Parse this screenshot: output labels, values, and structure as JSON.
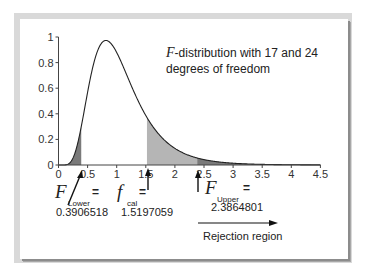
{
  "chart_data": {
    "type": "area",
    "title": "F-distribution with 17 and 24 degrees of freedom",
    "title_lines": [
      "-distribution with 17 and 24",
      "degrees of freedom"
    ],
    "title_italic_prefix": "F",
    "distribution": {
      "name": "F",
      "df1": 17,
      "df2": 24
    },
    "xlabel": "",
    "ylabel": "",
    "xlim": [
      0,
      4.5
    ],
    "ylim": [
      0,
      1
    ],
    "x_ticks": [
      0,
      0.5,
      1,
      1.5,
      2,
      2.5,
      3,
      3.5,
      4,
      4.5
    ],
    "x_tick_labels": [
      "0",
      "0.5",
      "1",
      "1.5",
      "2",
      "2.5",
      "3",
      "3.5",
      "4",
      "4.5"
    ],
    "y_ticks": [
      0,
      0.2,
      0.4,
      0.6,
      0.8,
      1
    ],
    "y_tick_labels": [
      "0",
      "0.2",
      "0.4",
      "0.6",
      "0.8",
      "1"
    ],
    "grid": false,
    "peak": {
      "x": 0.84,
      "y": 0.97
    },
    "shaded_regions": [
      {
        "name": "lower-tail",
        "from": 0,
        "to": 0.3906518,
        "color": "#7a7a7a"
      },
      {
        "name": "p-value-region",
        "from": 1.5197059,
        "to": 4.5,
        "color": "#b5b5b5"
      },
      {
        "name": "upper-tail",
        "from": 2.3864801,
        "to": 4.5,
        "color": "#7a7a7a"
      }
    ],
    "annotations": [
      {
        "symbol": "F",
        "subscript": "Lower",
        "equals": "=",
        "value": "0.3906518",
        "x": 0.3906518
      },
      {
        "symbol": "f",
        "subscript": "cal",
        "equals": "=",
        "value": "1.5197059",
        "x": 1.5197059
      },
      {
        "symbol": "F",
        "subscript": "Upper",
        "equals": "=",
        "value": "2.3864801",
        "x": 2.3864801
      }
    ],
    "rejection_label": "Rejection region"
  },
  "colors": {
    "curve": "#222222",
    "axis": "#444444",
    "dark_shade": "#7a7a7a",
    "light_shade": "#b5b5b5",
    "frame": "#d9d9d9"
  }
}
